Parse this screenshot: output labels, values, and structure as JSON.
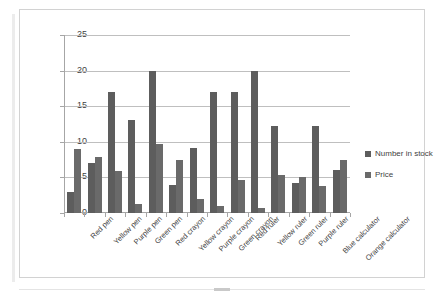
{
  "chart_data": {
    "type": "bar",
    "title": "",
    "xlabel": "",
    "ylabel": "",
    "ylim": [
      0,
      25
    ],
    "yticks": [
      0,
      5,
      10,
      15,
      20,
      25
    ],
    "grid": true,
    "legend_position": "right",
    "categories": [
      "Red pen",
      "Yellow pen",
      "Purple pen",
      "Green pen",
      "Red crayon",
      "Yellow crayon",
      "Purple crayon",
      "Green crayon",
      "Red ruler",
      "Yellow ruler",
      "Green ruler",
      "Purple ruler",
      "Blue calculator",
      "Orange calculator"
    ],
    "series": [
      {
        "name": "Number in stock",
        "color": "#5d5d5d",
        "values": [
          3,
          7,
          17,
          13,
          20,
          4,
          9.1,
          17,
          17,
          20,
          12.2,
          4.2,
          12.2,
          6.1
        ]
      },
      {
        "name": "Price",
        "color": "#6a6a6a",
        "values": [
          9,
          7.8,
          5.9,
          1.2,
          9.7,
          7.4,
          1.9,
          1.0,
          4.7,
          0.7,
          5.4,
          5.1,
          3.8,
          7.4
        ]
      }
    ]
  },
  "legend": {
    "items": [
      {
        "label": "Number in stock"
      },
      {
        "label": "Price"
      }
    ]
  }
}
